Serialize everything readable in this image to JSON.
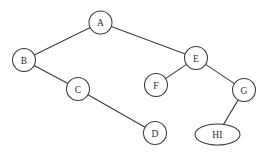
{
  "diagram": {
    "type": "tree",
    "title": "",
    "canvas": {
      "width": 271,
      "height": 154,
      "background": "#ffffff"
    },
    "style": {
      "stroke_color": "#3a3a3a",
      "node_fill": "#ffffff",
      "label_color": "#2e2e2e",
      "stroke_width": 1.05
    },
    "nodes": [
      {
        "id": "A",
        "label": "A",
        "cx": 100.5,
        "cy": 22.5,
        "rx": 11.5,
        "ry": 11.5,
        "shape": "circle"
      },
      {
        "id": "B",
        "label": "B",
        "cx": 24.0,
        "cy": 60.0,
        "rx": 11.5,
        "ry": 11.5,
        "shape": "circle"
      },
      {
        "id": "C",
        "label": "C",
        "cx": 78.0,
        "cy": 89.0,
        "rx": 11.5,
        "ry": 11.5,
        "shape": "circle"
      },
      {
        "id": "D",
        "label": "D",
        "cx": 155.0,
        "cy": 133.0,
        "rx": 11.5,
        "ry": 11.5,
        "shape": "circle"
      },
      {
        "id": "E",
        "label": "E",
        "cx": 196.0,
        "cy": 58.0,
        "rx": 11.5,
        "ry": 11.5,
        "shape": "circle"
      },
      {
        "id": "F",
        "label": "F",
        "cx": 156.0,
        "cy": 85.0,
        "rx": 11.5,
        "ry": 11.5,
        "shape": "circle"
      },
      {
        "id": "G",
        "label": "G",
        "cx": 244.0,
        "cy": 90.0,
        "rx": 11.5,
        "ry": 11.5,
        "shape": "circle"
      },
      {
        "id": "HI",
        "label": "HI",
        "cx": 217.5,
        "cy": 134.5,
        "rx": 22.5,
        "ry": 10.5,
        "shape": "ellipse"
      }
    ],
    "edges": [
      {
        "from": "A",
        "to": "B"
      },
      {
        "from": "A",
        "to": "E"
      },
      {
        "from": "B",
        "to": "C"
      },
      {
        "from": "C",
        "to": "D"
      },
      {
        "from": "E",
        "to": "F"
      },
      {
        "from": "E",
        "to": "G"
      },
      {
        "from": "G",
        "to": "HI"
      }
    ]
  }
}
